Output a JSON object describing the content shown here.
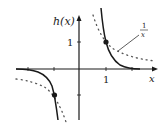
{
  "figure": {
    "y_axis_label": "h(x)",
    "x_axis_label": "x",
    "x_tick_label": "1",
    "y_tick_label": "1",
    "dotted_curve_label_num": "1",
    "dotted_curve_label_den": "x",
    "highlighted_points": [
      {
        "x": 1,
        "y": 1
      },
      {
        "x": -1,
        "y": -1
      }
    ],
    "curves": [
      {
        "name": "h(x)",
        "style": "solid"
      },
      {
        "name": "1/x",
        "style": "dotted"
      }
    ],
    "colors": {
      "solid": "#1a1a1a",
      "dotted": "#555555",
      "axis": "#1a1a1a"
    }
  }
}
